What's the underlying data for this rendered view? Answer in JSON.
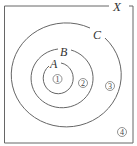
{
  "diagram": {
    "type": "euler",
    "universe_label": "X",
    "sets": [
      {
        "label": "A",
        "contained_in": "B"
      },
      {
        "label": "B",
        "contained_in": "C"
      },
      {
        "label": "C",
        "contained_in": "X"
      }
    ],
    "regions": [
      {
        "label": "1",
        "location": "inside A"
      },
      {
        "label": "2",
        "location": "inside B, outside A"
      },
      {
        "label": "3",
        "location": "inside C, outside B"
      },
      {
        "label": "4",
        "location": "inside X, outside C"
      }
    ],
    "colors": {
      "stroke": "#555555",
      "background": "#ffffff"
    }
  }
}
